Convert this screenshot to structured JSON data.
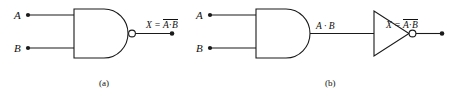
{
  "figure": {
    "background_color": "#ffffff",
    "ink_color": "#1a1a1a"
  },
  "circuits": [
    {
      "id": "a",
      "caption": "(a)",
      "gates": [
        {
          "name": "nand-gate",
          "type": "NAND",
          "has_bubble": true
        }
      ],
      "inputs": [
        {
          "label": "A"
        },
        {
          "label": "B"
        }
      ],
      "output": {
        "prefix": "X =",
        "overline_expression": "A · B",
        "operand_a": "A",
        "operator": "·",
        "operand_b": "B"
      }
    },
    {
      "id": "b",
      "caption": "(b)",
      "gates": [
        {
          "name": "and-gate",
          "type": "AND",
          "has_bubble": false
        },
        {
          "name": "inverter-gate",
          "type": "NOT",
          "has_bubble": true
        }
      ],
      "inputs": [
        {
          "label": "A"
        },
        {
          "label": "B"
        }
      ],
      "intermediate": {
        "label": "A · B"
      },
      "output": {
        "prefix": "X =",
        "overline_expression": "A · B",
        "operand_a": "A",
        "operator": "·",
        "operand_b": "B"
      }
    }
  ]
}
